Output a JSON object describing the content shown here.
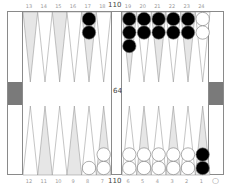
{
  "pip_counts": {
    "top": "110",
    "middle": "64",
    "bottom": "110"
  },
  "top_labels": [
    "13",
    "14",
    "15",
    "16",
    "17",
    "18",
    "19",
    "20",
    "21",
    "22",
    "23",
    "24"
  ],
  "bottom_labels": [
    "12",
    "11",
    "10",
    "9",
    "8",
    "7",
    "6",
    "5",
    "4",
    "3",
    "2",
    "1"
  ],
  "bottom_right_symbol": "○",
  "colors": {
    "dark_point": "#e6e6e6",
    "light_point": "#ffffff",
    "outline": "#8a8a8a",
    "black_checker": "#000000",
    "white_checker": "#ffffff",
    "cube": "#7a7a7a"
  },
  "position": {
    "top": [
      {
        "point": "13",
        "checkers": 0,
        "color": ""
      },
      {
        "point": "14",
        "checkers": 0,
        "color": ""
      },
      {
        "point": "15",
        "checkers": 0,
        "color": ""
      },
      {
        "point": "16",
        "checkers": 0,
        "color": ""
      },
      {
        "point": "17",
        "checkers": 2,
        "color": "black"
      },
      {
        "point": "18",
        "checkers": 0,
        "color": ""
      },
      {
        "point": "19",
        "checkers": 3,
        "color": "black"
      },
      {
        "point": "20",
        "checkers": 2,
        "color": "black"
      },
      {
        "point": "21",
        "checkers": 2,
        "color": "black"
      },
      {
        "point": "22",
        "checkers": 2,
        "color": "black"
      },
      {
        "point": "23",
        "checkers": 2,
        "color": "black"
      },
      {
        "point": "24",
        "checkers": 2,
        "color": "white"
      }
    ],
    "bottom": [
      {
        "point": "12",
        "checkers": 0,
        "color": ""
      },
      {
        "point": "11",
        "checkers": 0,
        "color": ""
      },
      {
        "point": "10",
        "checkers": 0,
        "color": ""
      },
      {
        "point": "9",
        "checkers": 0,
        "color": ""
      },
      {
        "point": "8",
        "checkers": 1,
        "color": "white"
      },
      {
        "point": "7",
        "checkers": 2,
        "color": "white"
      },
      {
        "point": "6",
        "checkers": 2,
        "color": "white"
      },
      {
        "point": "5",
        "checkers": 2,
        "color": "white"
      },
      {
        "point": "4",
        "checkers": 2,
        "color": "white"
      },
      {
        "point": "3",
        "checkers": 2,
        "color": "white"
      },
      {
        "point": "2",
        "checkers": 2,
        "color": "white"
      },
      {
        "point": "1",
        "checkers": 2,
        "color": "black"
      }
    ]
  }
}
